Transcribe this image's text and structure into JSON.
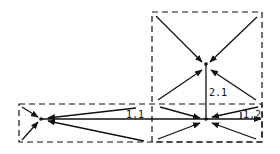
{
  "diagram": {
    "labels": {
      "segment_1_1": "1.1",
      "segment_1_2": "1.2",
      "segment_2_1": "2.1"
    },
    "colors": {
      "stroke": "#111111",
      "background": "#ffffff"
    },
    "regions": [
      {
        "name": "upper-region",
        "x": 152,
        "y": 12,
        "w": 110,
        "h": 130
      },
      {
        "name": "lower-region",
        "x": 18,
        "y": 104,
        "w": 244,
        "h": 38
      }
    ],
    "nodes": [
      {
        "name": "node-left",
        "x": 41,
        "y": 119
      },
      {
        "name": "node-center",
        "x": 206,
        "y": 119
      },
      {
        "name": "node-top",
        "x": 206,
        "y": 64
      }
    ]
  }
}
